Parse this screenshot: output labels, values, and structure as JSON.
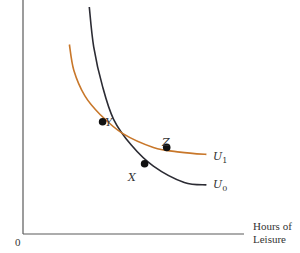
{
  "chart_data": {
    "type": "line",
    "title": "",
    "xlabel": "Hours of Leisure",
    "xlabel_lines": [
      "Hours of",
      "Leisure"
    ],
    "ylabel": "",
    "origin_label": "0",
    "grid": false,
    "series": [
      {
        "name": "U0",
        "label_main": "U",
        "label_sub": "0",
        "color": "#2b2b33",
        "description": "steeper indifference curve",
        "points": [
          [
            0.3,
            0.97
          ],
          [
            0.32,
            0.8
          ],
          [
            0.36,
            0.63
          ],
          [
            0.41,
            0.49
          ],
          [
            0.49,
            0.38
          ],
          [
            0.59,
            0.29
          ],
          [
            0.73,
            0.22
          ],
          [
            0.83,
            0.21
          ]
        ]
      },
      {
        "name": "U1",
        "label_main": "U",
        "label_sub": "1",
        "color": "#c8772a",
        "description": "flatter indifference curve",
        "points": [
          [
            0.21,
            0.81
          ],
          [
            0.23,
            0.7
          ],
          [
            0.28,
            0.59
          ],
          [
            0.35,
            0.51
          ],
          [
            0.45,
            0.43
          ],
          [
            0.59,
            0.37
          ],
          [
            0.71,
            0.35
          ],
          [
            0.83,
            0.34
          ]
        ]
      }
    ],
    "points": [
      {
        "name": "Y",
        "x": 0.36,
        "y": 0.48,
        "description": "intersection of U0 and U1"
      },
      {
        "name": "Z",
        "x": 0.65,
        "y": 0.37,
        "on": "U1"
      },
      {
        "name": "X",
        "x": 0.55,
        "y": 0.3,
        "on": "U0"
      }
    ]
  }
}
